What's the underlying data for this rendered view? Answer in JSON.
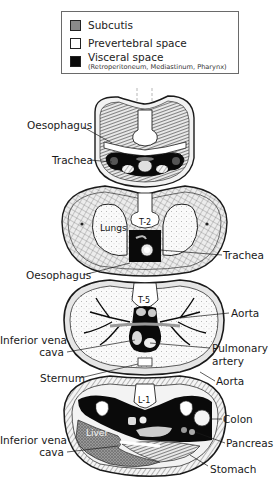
{
  "legend": {
    "items": [
      {
        "label": "Subcutis",
        "swatch_color": "#8a8a8a"
      },
      {
        "label": "Prevertebral space",
        "swatch_color": "#ffffff"
      },
      {
        "label": "Visceral space",
        "sublabel": "(Retroperitoneum, Mediastinum, Pharynx)",
        "swatch_color": "#0a0a0a"
      }
    ]
  },
  "sections": [
    {
      "id": "neck",
      "labels": [
        {
          "text": "Oesophagus",
          "side": "left"
        },
        {
          "text": "Trachea",
          "side": "left"
        }
      ]
    },
    {
      "id": "thorax-t2",
      "vertebra": "T-2",
      "inner_labels": [
        "Lungs"
      ],
      "labels": [
        {
          "text": "Trachea",
          "side": "right"
        },
        {
          "text": "Oesophagus",
          "side": "left"
        }
      ]
    },
    {
      "id": "thorax-t5",
      "vertebra": "T-5",
      "labels": [
        {
          "text": "Aorta",
          "side": "right"
        },
        {
          "text": "Inferior vena",
          "text2": "cava",
          "side": "left"
        },
        {
          "text": "Pulmonary",
          "text2": "artery",
          "side": "right"
        },
        {
          "text": "Sternum",
          "side": "left"
        },
        {
          "text": "Aorta",
          "side": "right"
        }
      ]
    },
    {
      "id": "abdomen-l1",
      "vertebra": "L-1",
      "inner_labels": [
        "Liver"
      ],
      "labels": [
        {
          "text": "Colon",
          "side": "right"
        },
        {
          "text": "Inferior vena",
          "text2": "cava",
          "side": "left"
        },
        {
          "text": "Pancreas",
          "side": "right"
        },
        {
          "text": "Stomach",
          "side": "right"
        }
      ]
    }
  ],
  "colors": {
    "subcutis": "#8a8a8a",
    "prevertebral": "#ffffff",
    "visceral": "#0a0a0a",
    "line": "#1a1a1a"
  }
}
